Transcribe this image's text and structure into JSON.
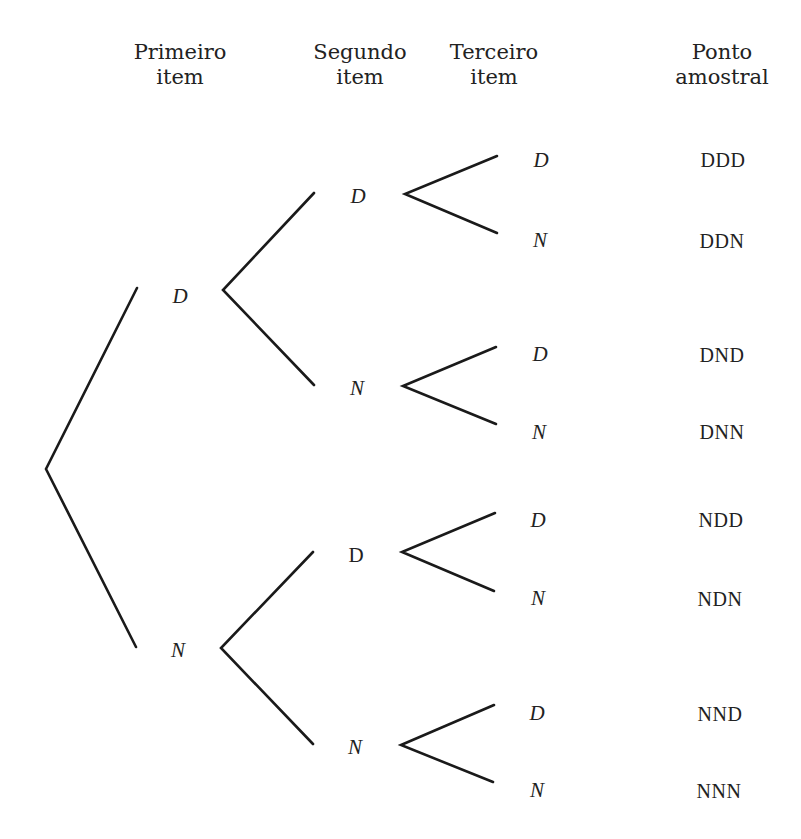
{
  "headers": [
    {
      "line1": "Primeiro",
      "line2": "item"
    },
    {
      "line1": "Segundo",
      "line2": "item"
    },
    {
      "line1": "Terceiro",
      "line2": "item"
    },
    {
      "line1": "Ponto",
      "line2": "amostral"
    }
  ],
  "level1": [
    {
      "label": "D"
    },
    {
      "label": "N"
    }
  ],
  "level2": [
    {
      "label": "D"
    },
    {
      "label": "N"
    },
    {
      "label": "D"
    },
    {
      "label": "N"
    }
  ],
  "level3": [
    {
      "label": "D"
    },
    {
      "label": "N"
    },
    {
      "label": "D"
    },
    {
      "label": "N"
    },
    {
      "label": "D"
    },
    {
      "label": "N"
    },
    {
      "label": "D"
    },
    {
      "label": "N"
    }
  ],
  "sample_points": [
    "DDD",
    "DDN",
    "DND",
    "DNN",
    "NDD",
    "NDN",
    "NND",
    "NNN"
  ],
  "colors": {
    "line": "#1a1a1a",
    "text": "#222222",
    "background": "#ffffff"
  }
}
